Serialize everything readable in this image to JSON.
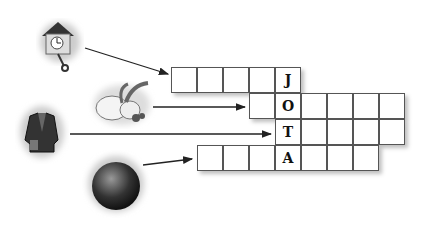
{
  "puzzle": {
    "type": "crossword",
    "vertical_word": "JOTA",
    "rows": [
      {
        "clue_icon": "cuckoo-clock",
        "start_col": 0,
        "length": 5,
        "letters": [
          "",
          "",
          "",
          "",
          "J"
        ]
      },
      {
        "clue_icon": "rabbit",
        "start_col": 3,
        "length": 6,
        "letters": [
          "",
          "O",
          "",
          "",
          "",
          ""
        ]
      },
      {
        "clue_icon": "jacket",
        "start_col": 4,
        "length": 5,
        "letters": [
          "T",
          "",
          "",
          "",
          ""
        ]
      },
      {
        "clue_icon": "ball",
        "start_col": 1,
        "length": 7,
        "letters": [
          "",
          "",
          "",
          "A",
          "",
          "",
          ""
        ]
      }
    ]
  }
}
